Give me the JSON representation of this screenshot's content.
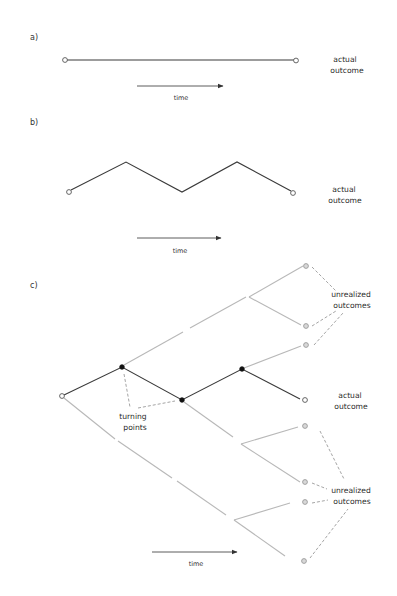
{
  "figure": {
    "background": "#ffffff",
    "colors": {
      "actual_path": "#3a3a3a",
      "unrealized_path": "#b8b8b8",
      "dashed_leader": "#9a9a9a",
      "turning_point": "#111111",
      "unrealized_node_fill": "#d8d8d8"
    }
  },
  "panels": {
    "a": {
      "label": "a)",
      "outcome_label_line1": "actual",
      "outcome_label_line2": "outcome",
      "time_label": "time"
    },
    "b": {
      "label": "b)",
      "outcome_label_line1": "actual",
      "outcome_label_line2": "outcome",
      "time_label": "time"
    },
    "c": {
      "label": "c)",
      "unrealized_top_line1": "unrealized",
      "unrealized_top_line2": "outcomes",
      "actual_line1": "actual",
      "actual_line2": "outcome",
      "turning_line1": "turning",
      "turning_line2": "points",
      "unrealized_bottom_line1": "unrealized",
      "unrealized_bottom_line2": "outcomes",
      "time_label": "time"
    }
  },
  "icons": {
    "time_arrow": "arrow-right-icon",
    "start_node": "open-circle-icon",
    "turning_point": "filled-circle-icon",
    "unrealized_node": "gray-circle-icon"
  }
}
